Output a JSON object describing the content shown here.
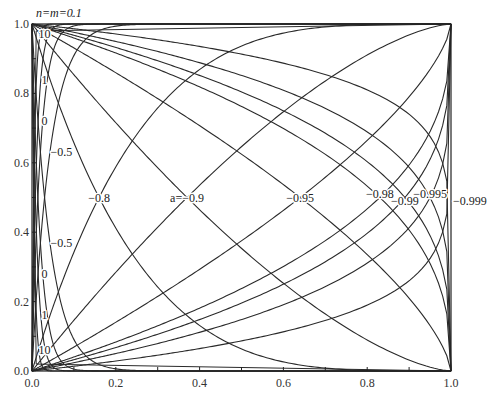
{
  "chart_data": {
    "type": "line",
    "title": "n=m=0.1",
    "xlabel": "",
    "ylabel": "",
    "xlim": [
      0.0,
      1.0
    ],
    "ylim": [
      0.0,
      1.0
    ],
    "grid": false,
    "x_ticks": [
      "0.0",
      "0.2",
      "0.4",
      "0.6",
      "0.8",
      "1.0"
    ],
    "y_ticks": [
      "0.0",
      "0.2",
      "0.4",
      "0.6",
      "0.8",
      "1.0"
    ],
    "plot_area_px": {
      "left": 32,
      "top": 24,
      "right": 451,
      "bottom": 371
    },
    "series": [
      {
        "name": "10",
        "crossing_x": 0.004
      },
      {
        "name": "1",
        "crossing_x": 0.008
      },
      {
        "name": "0",
        "crossing_x": 0.014
      },
      {
        "name": "-0.5",
        "crossing_x": 0.03
      },
      {
        "name": "-0.8",
        "crossing_x": 0.16
      },
      {
        "name": "-0.9",
        "crossing_x": 0.37
      },
      {
        "name": "-0.95",
        "crossing_x": 0.64
      },
      {
        "name": "-0.98",
        "crossing_x": 0.83
      },
      {
        "name": "-0.99",
        "crossing_x": 0.89
      },
      {
        "name": "-0.995",
        "crossing_x": 0.95
      },
      {
        "name": "-0.999",
        "crossing_x": 0.995
      }
    ],
    "annotations": [
      {
        "text": "n=m=0.1",
        "x": 0.0,
        "y": 1.02
      },
      {
        "text": "10",
        "x": 0.03,
        "y": 0.97
      },
      {
        "text": "1",
        "x": 0.03,
        "y": 0.84
      },
      {
        "text": "0",
        "x": 0.03,
        "y": 0.72
      },
      {
        "text": "-0.5",
        "x": 0.07,
        "y": 0.63
      },
      {
        "text": "-0.8",
        "x": 0.16,
        "y": 0.5
      },
      {
        "text": "a=-0.9",
        "x": 0.37,
        "y": 0.5
      },
      {
        "text": "-0.95",
        "x": 0.64,
        "y": 0.5
      },
      {
        "text": "-0.98",
        "x": 0.83,
        "y": 0.51
      },
      {
        "text": "-0.99",
        "x": 0.89,
        "y": 0.49
      },
      {
        "text": "-0.995",
        "x": 0.95,
        "y": 0.51
      },
      {
        "text": "-0.999",
        "x": 1.02,
        "y": 0.49
      },
      {
        "text": "-0.5",
        "x": 0.07,
        "y": 0.37
      },
      {
        "text": "0",
        "x": 0.03,
        "y": 0.28
      },
      {
        "text": "1",
        "x": 0.03,
        "y": 0.16
      },
      {
        "text": "10",
        "x": 0.03,
        "y": 0.06
      }
    ]
  },
  "labels": {
    "title": "n=m=0.1",
    "upper": [
      {
        "text": "10",
        "px": 40,
        "py": 40
      },
      {
        "text": "1",
        "px": 42,
        "py": 100
      },
      {
        "text": "0",
        "px": 47,
        "py": 142
      },
      {
        "text": "−0.5",
        "px": 62,
        "py": 142
      }
    ]
  }
}
